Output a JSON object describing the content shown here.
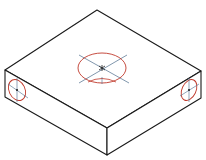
{
  "figure": {
    "title": "Isometric block with drilled holes",
    "width": 206,
    "height": 160,
    "colors": {
      "background": "#ffffff",
      "outline": "#1a1a1a",
      "hole": "#c0392b",
      "centerline": "#4a6a8a"
    },
    "block": {
      "top_face": [
        [
          97,
          10
        ],
        [
          201,
          71
        ],
        [
          107,
          128
        ],
        [
          5,
          70
        ]
      ],
      "left_face": [
        [
          5,
          70
        ],
        [
          107,
          128
        ],
        [
          107,
          155
        ],
        [
          5,
          97
        ]
      ],
      "right_face": [
        [
          107,
          128
        ],
        [
          201,
          71
        ],
        [
          201,
          98
        ],
        [
          107,
          155
        ]
      ]
    },
    "holes": [
      {
        "name": "top-hole",
        "face": "top",
        "cx": 102,
        "cy": 68,
        "rx": 24,
        "ry": 15
      },
      {
        "name": "left-hole",
        "face": "left",
        "cx": 17,
        "cy": 90,
        "rx": 8,
        "ry": 11
      },
      {
        "name": "right-hole",
        "face": "right",
        "cx": 189,
        "cy": 90,
        "rx": 7,
        "ry": 11
      }
    ]
  }
}
